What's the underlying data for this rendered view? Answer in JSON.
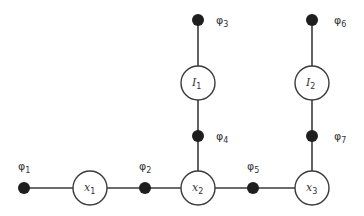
{
  "diagram": {
    "type": "factor-graph",
    "colors": {
      "edge": "#3a3a3a",
      "factor_fill": "#1e1e1e",
      "variable_fill": "#ffffff",
      "text": "#333333"
    },
    "variables": [
      {
        "id": "x1",
        "base": "x",
        "sub": "1",
        "cx": 90,
        "cy": 188,
        "r": 17
      },
      {
        "id": "x2",
        "base": "x",
        "sub": "2",
        "cx": 198,
        "cy": 188,
        "r": 17
      },
      {
        "id": "x3",
        "base": "x",
        "sub": "3",
        "cx": 312,
        "cy": 188,
        "r": 17
      },
      {
        "id": "I1",
        "base": "I",
        "sub": "1",
        "cx": 198,
        "cy": 83,
        "r": 17
      },
      {
        "id": "I2",
        "base": "I",
        "sub": "2",
        "cx": 312,
        "cy": 83,
        "r": 17
      }
    ],
    "factors": [
      {
        "id": "phi1",
        "base": "φ",
        "sub": "1",
        "cx": 24,
        "cy": 188,
        "lx": 18,
        "ly": 170
      },
      {
        "id": "phi2",
        "base": "φ",
        "sub": "2",
        "cx": 145,
        "cy": 188,
        "lx": 139,
        "ly": 170
      },
      {
        "id": "phi3",
        "base": "φ",
        "sub": "3",
        "cx": 198,
        "cy": 20,
        "lx": 216,
        "ly": 24
      },
      {
        "id": "phi4",
        "base": "φ",
        "sub": "4",
        "cx": 198,
        "cy": 136,
        "lx": 216,
        "ly": 140
      },
      {
        "id": "phi5",
        "base": "φ",
        "sub": "5",
        "cx": 253,
        "cy": 188,
        "lx": 247,
        "ly": 170
      },
      {
        "id": "phi6",
        "base": "φ",
        "sub": "6",
        "cx": 312,
        "cy": 20,
        "lx": 334,
        "ly": 24
      },
      {
        "id": "phi7",
        "base": "φ",
        "sub": "7",
        "cx": 312,
        "cy": 136,
        "lx": 334,
        "ly": 140
      }
    ],
    "edges": [
      {
        "from": "phi1",
        "to": "x1"
      },
      {
        "from": "x1",
        "to": "phi2"
      },
      {
        "from": "phi2",
        "to": "x2"
      },
      {
        "from": "x2",
        "to": "phi5"
      },
      {
        "from": "phi5",
        "to": "x3"
      },
      {
        "from": "phi3",
        "to": "I1"
      },
      {
        "from": "I1",
        "to": "phi4"
      },
      {
        "from": "phi4",
        "to": "x2"
      },
      {
        "from": "phi6",
        "to": "I2"
      },
      {
        "from": "I2",
        "to": "phi7"
      },
      {
        "from": "phi7",
        "to": "x3"
      }
    ],
    "factor_radius": 6
  }
}
